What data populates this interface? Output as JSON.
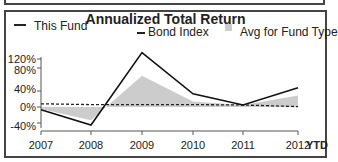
{
  "chart_data": {
    "type": "line",
    "title": "Annualized Total Return",
    "xlabel": "",
    "ylabel": "",
    "categories": [
      "2007",
      "2008",
      "2009",
      "2010",
      "2011",
      "2012"
    ],
    "x_suffix_label": "YTD",
    "yticks": [
      "120%",
      "80%",
      "40%",
      "0%",
      "-40%"
    ],
    "ylim": [
      -45,
      140
    ],
    "grid": false,
    "legend_position": "top",
    "series": [
      {
        "name": "This Fund",
        "style": "solid-line",
        "values": [
          -7,
          -45,
          136,
          33,
          5,
          48
        ]
      },
      {
        "name": "Bond Index",
        "style": "dashed-line",
        "values": [
          8,
          6,
          6,
          6,
          5,
          1
        ]
      },
      {
        "name": "Avg for Fund Type",
        "style": "gray-area",
        "values": [
          -5,
          -33,
          78,
          14,
          5,
          29
        ]
      }
    ]
  },
  "legend": {
    "fund": "This Fund",
    "bond": "Bond Index",
    "avg": "Avg for Fund Type"
  },
  "colors": {
    "fund": "#111111",
    "bond": "#222222",
    "avg": "#cccccc"
  }
}
